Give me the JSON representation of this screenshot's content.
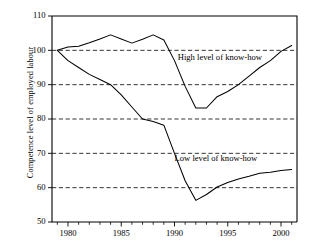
{
  "chart_data": {
    "type": "line",
    "title": "",
    "subtitle": "",
    "xlabel": "",
    "ylabel": "Competence level of employed labour",
    "xlim": [
      1978.5,
      2001.5
    ],
    "ylim": [
      50,
      110
    ],
    "grid": true,
    "gridlines_y": [
      60,
      70,
      80,
      90,
      100
    ],
    "y_ticks": [
      50,
      60,
      70,
      80,
      90,
      100,
      110
    ],
    "y_tick_labels": [
      "50",
      "60",
      "70",
      "80",
      "90",
      "100",
      "110"
    ],
    "x_ticks": [
      1980,
      1985,
      1990,
      1995,
      2000
    ],
    "x_tick_labels": [
      "1980",
      "1985",
      "1990",
      "1995",
      "2000"
    ],
    "x_minor_ticks": [
      1979,
      1981,
      1982,
      1983,
      1984,
      1986,
      1987,
      1988,
      1989,
      1991,
      1992,
      1993,
      1994,
      1996,
      1997,
      1998,
      1999,
      2001
    ],
    "legend_position": "inline-annotation",
    "line_color": "#000000",
    "series": [
      {
        "name": "High level of know-how",
        "label": "High level of know-how",
        "label_x": 1990.3,
        "label_y": 97.2,
        "x": [
          1979,
          1980,
          1981,
          1982,
          1983,
          1984,
          1985,
          1986,
          1987,
          1988,
          1989,
          1990,
          1991,
          1992,
          1993,
          1994,
          1995,
          1996,
          1997,
          1998,
          1999,
          2000,
          2001
        ],
        "values": [
          100.0,
          101.0,
          101.2,
          102.2,
          103.3,
          104.5,
          103.3,
          102.1,
          103.2,
          104.5,
          103.0,
          97.0,
          89.5,
          83.2,
          83.2,
          86.5,
          88.0,
          90.0,
          92.5,
          95.0,
          97.0,
          99.7,
          101.4
        ]
      },
      {
        "name": "Low level of know-how",
        "label": "Low level of know-how",
        "label_x": 1990.0,
        "label_y": 67.8,
        "x": [
          1979,
          1980,
          1981,
          1982,
          1983,
          1984,
          1985,
          1986,
          1987,
          1988,
          1989,
          1990,
          1991,
          1992,
          1993,
          1994,
          1995,
          1996,
          1997,
          1998,
          1999,
          2000,
          2001
        ],
        "values": [
          100.0,
          97.0,
          95.0,
          93.0,
          91.5,
          90.0,
          87.0,
          83.5,
          80.0,
          79.3,
          78.2,
          70.0,
          62.0,
          56.3,
          58.0,
          60.2,
          61.5,
          62.5,
          63.3,
          64.2,
          64.5,
          65.0,
          65.3
        ]
      }
    ]
  }
}
